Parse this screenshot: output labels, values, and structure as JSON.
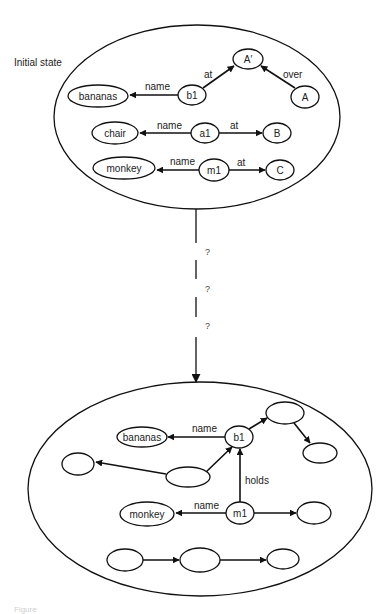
{
  "diagram": {
    "initial_state_label": "Initial state",
    "initial": {
      "nodes": [
        {
          "id": "A_prime",
          "label": "A′"
        },
        {
          "id": "A",
          "label": "A"
        },
        {
          "id": "b1",
          "label": "b1"
        },
        {
          "id": "bananas",
          "label": "bananas"
        },
        {
          "id": "chair",
          "label": "chair"
        },
        {
          "id": "a1",
          "label": "a1"
        },
        {
          "id": "B",
          "label": "B"
        },
        {
          "id": "monkey",
          "label": "monkey"
        },
        {
          "id": "m1",
          "label": "m1"
        },
        {
          "id": "C",
          "label": "C"
        }
      ],
      "edges": [
        {
          "from": "b1",
          "to": "bananas",
          "label": "name"
        },
        {
          "from": "b1",
          "to": "A_prime",
          "label": "at"
        },
        {
          "from": "A",
          "to": "A_prime",
          "label": "over"
        },
        {
          "from": "a1",
          "to": "chair",
          "label": "name"
        },
        {
          "from": "a1",
          "to": "B",
          "label": "at"
        },
        {
          "from": "m1",
          "to": "monkey",
          "label": "name"
        },
        {
          "from": "m1",
          "to": "C",
          "label": "at"
        }
      ]
    },
    "transition": {
      "steps": [
        "?",
        "?",
        "?"
      ]
    },
    "goal": {
      "nodes": [
        {
          "id": "bananas",
          "label": "bananas"
        },
        {
          "id": "b1",
          "label": "b1"
        },
        {
          "id": "monkey",
          "label": "monkey"
        },
        {
          "id": "m1",
          "label": "m1"
        },
        {
          "id": "e1",
          "label": ""
        },
        {
          "id": "e2",
          "label": ""
        },
        {
          "id": "e3",
          "label": ""
        },
        {
          "id": "e4",
          "label": ""
        },
        {
          "id": "e5",
          "label": ""
        },
        {
          "id": "e6",
          "label": ""
        },
        {
          "id": "e7",
          "label": ""
        },
        {
          "id": "e8",
          "label": ""
        }
      ],
      "edges": [
        {
          "from": "b1",
          "to": "bananas",
          "label": "name"
        },
        {
          "from": "m1",
          "to": "b1",
          "label": "holds"
        },
        {
          "from": "m1",
          "to": "monkey",
          "label": "name"
        }
      ]
    },
    "caption": "Figure"
  }
}
